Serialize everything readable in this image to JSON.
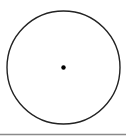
{
  "diagram": {
    "type": "circle-with-center",
    "circle": {
      "cx": 63.5,
      "cy": 67.5,
      "r": 56.5,
      "stroke": "#222222",
      "stroke_width": 1.4,
      "fill": "none"
    },
    "center_point": {
      "cx": 63.5,
      "cy": 67.5,
      "r": 2.2,
      "fill": "#000000"
    },
    "baseline": {
      "y": 134.5,
      "x1": 0,
      "x2": 126,
      "stroke": "#8a8a8a",
      "stroke_width": 1.5
    }
  }
}
